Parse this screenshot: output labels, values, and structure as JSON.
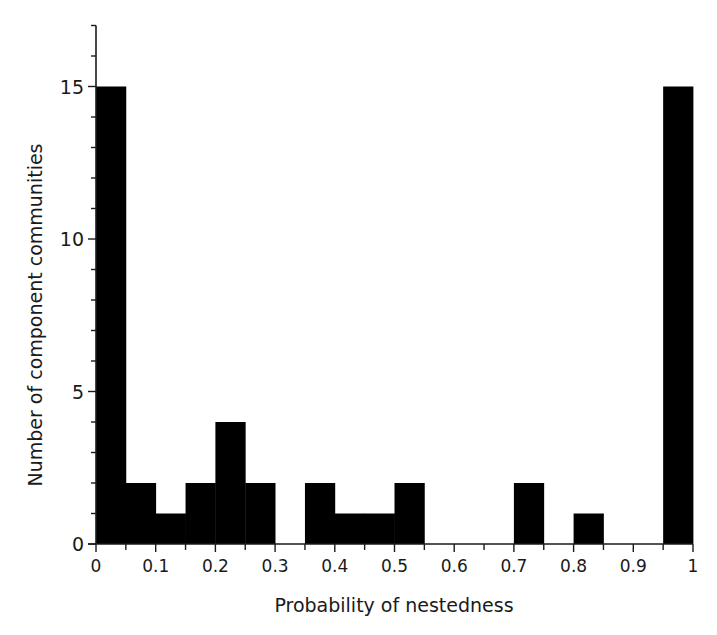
{
  "chart_data": {
    "type": "bar",
    "subtype": "histogram",
    "title": "",
    "xlabel": "Probability of nestedness",
    "ylabel": "Number of component communities",
    "bin_width": 0.05,
    "bins": [
      {
        "start": 0.0,
        "end": 0.05,
        "count": 15
      },
      {
        "start": 0.05,
        "end": 0.1,
        "count": 2
      },
      {
        "start": 0.1,
        "end": 0.15,
        "count": 1
      },
      {
        "start": 0.15,
        "end": 0.2,
        "count": 2
      },
      {
        "start": 0.2,
        "end": 0.25,
        "count": 4
      },
      {
        "start": 0.25,
        "end": 0.3,
        "count": 2
      },
      {
        "start": 0.3,
        "end": 0.35,
        "count": 0
      },
      {
        "start": 0.35,
        "end": 0.4,
        "count": 2
      },
      {
        "start": 0.4,
        "end": 0.45,
        "count": 1
      },
      {
        "start": 0.45,
        "end": 0.5,
        "count": 1
      },
      {
        "start": 0.5,
        "end": 0.55,
        "count": 2
      },
      {
        "start": 0.55,
        "end": 0.6,
        "count": 0
      },
      {
        "start": 0.6,
        "end": 0.65,
        "count": 0
      },
      {
        "start": 0.65,
        "end": 0.7,
        "count": 0
      },
      {
        "start": 0.7,
        "end": 0.75,
        "count": 2
      },
      {
        "start": 0.75,
        "end": 0.8,
        "count": 0
      },
      {
        "start": 0.8,
        "end": 0.85,
        "count": 1
      },
      {
        "start": 0.85,
        "end": 0.9,
        "count": 0
      },
      {
        "start": 0.9,
        "end": 0.95,
        "count": 0
      },
      {
        "start": 0.95,
        "end": 1.0,
        "count": 15
      }
    ],
    "categories": [
      "0-0.05",
      "0.05-0.1",
      "0.1-0.15",
      "0.15-0.2",
      "0.2-0.25",
      "0.25-0.3",
      "0.3-0.35",
      "0.35-0.4",
      "0.4-0.45",
      "0.45-0.5",
      "0.5-0.55",
      "0.55-0.6",
      "0.6-0.65",
      "0.65-0.7",
      "0.7-0.75",
      "0.75-0.8",
      "0.8-0.85",
      "0.85-0.9",
      "0.9-0.95",
      "0.95-1"
    ],
    "values": [
      15,
      2,
      1,
      2,
      4,
      2,
      0,
      2,
      1,
      1,
      2,
      0,
      0,
      0,
      2,
      0,
      1,
      0,
      0,
      15
    ],
    "xlim": [
      0,
      1
    ],
    "ylim": [
      0,
      17
    ],
    "x_ticks": [
      {
        "value": 0,
        "label": "0"
      },
      {
        "value": 0.1,
        "label": "0.1"
      },
      {
        "value": 0.2,
        "label": "0.2"
      },
      {
        "value": 0.3,
        "label": "0.3"
      },
      {
        "value": 0.4,
        "label": "0.4"
      },
      {
        "value": 0.5,
        "label": "0.5"
      },
      {
        "value": 0.6,
        "label": "0.6"
      },
      {
        "value": 0.7,
        "label": "0.7"
      },
      {
        "value": 0.8,
        "label": "0.8"
      },
      {
        "value": 0.9,
        "label": "0.9"
      },
      {
        "value": 1,
        "label": "1"
      }
    ],
    "x_minor_tick_step": 0.05,
    "y_ticks": [
      {
        "value": 0,
        "label": "0"
      },
      {
        "value": 5,
        "label": "5"
      },
      {
        "value": 10,
        "label": "10"
      },
      {
        "value": 15,
        "label": "15"
      }
    ],
    "y_minor_tick_step": 1,
    "grid": false,
    "legend": null,
    "bar_color": "#000000",
    "axis_color": "#1a1a1a"
  }
}
